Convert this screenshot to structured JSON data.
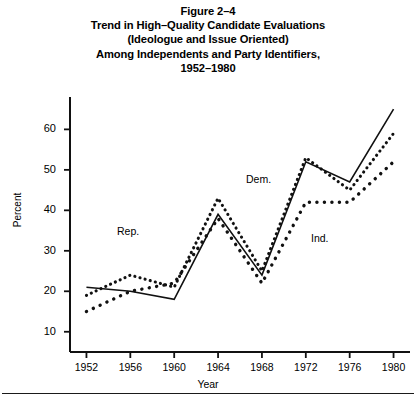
{
  "figure": {
    "title_lines": [
      "Figure 2–4",
      "Trend in High–Quality Candidate Evaluations",
      "(Ideologue and Issue Oriented)",
      "Among Independents and Party Identifiers,",
      "1952–1980"
    ]
  },
  "axes": {
    "y_label": "Percent",
    "x_label": "Year",
    "y_ticks": [
      "10",
      "20",
      "30",
      "40",
      "50",
      "60"
    ],
    "x_ticks": [
      "1952",
      "1956",
      "1960",
      "1964",
      "1968",
      "1972",
      "1976",
      "1980"
    ]
  },
  "annotations": {
    "rep": "Rep.",
    "dem": "Dem.",
    "ind": "Ind."
  },
  "chart_data": {
    "type": "line",
    "xlabel": "Year",
    "ylabel": "Percent",
    "x": [
      1952,
      1956,
      1960,
      1964,
      1968,
      1972,
      1976,
      1980
    ],
    "xlim": [
      1950.5,
      1981.5
    ],
    "ylim": [
      5,
      68
    ],
    "grid": false,
    "legend": "inline-annotations",
    "series": [
      {
        "name": "Dem.",
        "style": "solid",
        "values": [
          21,
          20,
          18,
          39,
          24,
          52,
          47,
          65
        ]
      },
      {
        "name": "Rep.",
        "style": "fine-dotted",
        "values": [
          19,
          24,
          21,
          43,
          25,
          53,
          45,
          59
        ]
      },
      {
        "name": "Ind.",
        "style": "coarse-dotted",
        "values": [
          15,
          20,
          22,
          38,
          22,
          42,
          42,
          52
        ]
      }
    ]
  },
  "footnote": ""
}
